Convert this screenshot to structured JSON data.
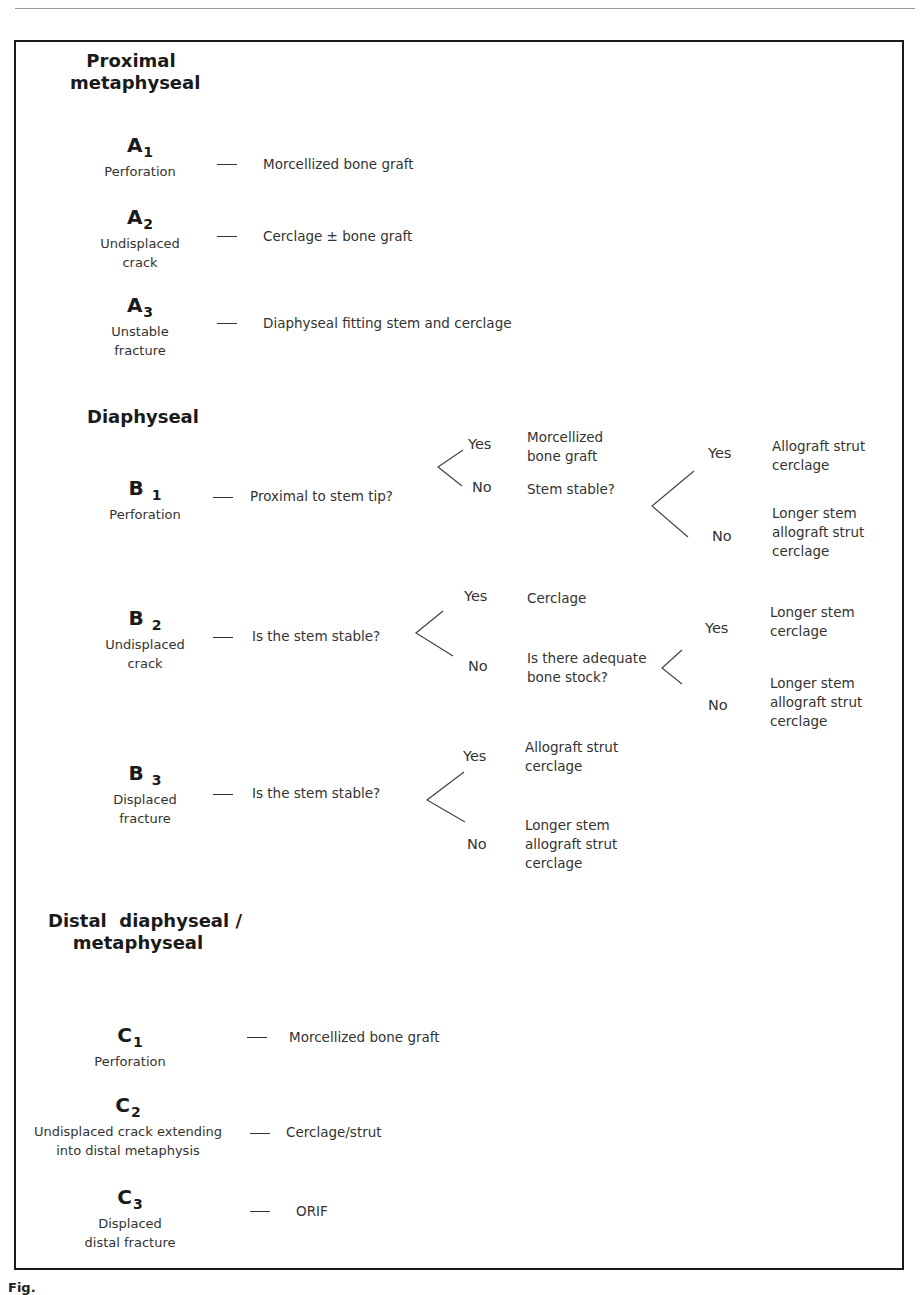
{
  "sections": [
    {
      "heading_lines": [
        "Proximal",
        "metaphyseal"
      ],
      "items": [
        {
          "code": "A",
          "sub": "1",
          "desc_lines": [
            "Perforation"
          ],
          "treatment": "Morcellized bone graft"
        },
        {
          "code": "A",
          "sub": "2",
          "desc_lines": [
            "Undisplaced",
            "crack"
          ],
          "treatment": "Cerclage ± bone graft"
        },
        {
          "code": "A",
          "sub": "3",
          "desc_lines": [
            "Unstable",
            "fracture"
          ],
          "treatment": "Diaphyseal fitting stem and cerclage"
        }
      ]
    },
    {
      "heading_lines": [
        "Diaphyseal"
      ],
      "items": [
        {
          "code": "B",
          "sub": "1",
          "desc_lines": [
            "Perforation"
          ],
          "question": "Proximal to stem tip?",
          "yes": {
            "label": "Yes",
            "outcome_lines": [
              "Morcellized",
              "bone graft"
            ]
          },
          "no": {
            "label": "No",
            "question": "Stem stable?",
            "yes": {
              "label": "Yes",
              "outcome_lines": [
                "Allograft strut",
                "cerclage"
              ]
            },
            "no": {
              "label": "No",
              "outcome_lines": [
                "Longer stem",
                "allograft strut",
                "cerclage"
              ]
            }
          }
        },
        {
          "code": "B",
          "sub": "2",
          "desc_lines": [
            "Undisplaced",
            "crack"
          ],
          "question": "Is the stem stable?",
          "yes": {
            "label": "Yes",
            "outcome_lines": [
              "Cerclage"
            ]
          },
          "no": {
            "label": "No",
            "question_lines": [
              "Is there adequate",
              "bone stock?"
            ],
            "yes": {
              "label": "Yes",
              "outcome_lines": [
                "Longer stem",
                "cerclage"
              ]
            },
            "no": {
              "label": "No",
              "outcome_lines": [
                "Longer stem",
                "allograft strut",
                "cerclage"
              ]
            }
          }
        },
        {
          "code": "B",
          "sub": "3",
          "desc_lines": [
            "Displaced",
            "fracture"
          ],
          "question": "Is the stem stable?",
          "yes": {
            "label": "Yes",
            "outcome_lines": [
              "Allograft strut",
              "cerclage"
            ]
          },
          "no": {
            "label": "No",
            "outcome_lines": [
              "Longer stem",
              "allograft strut",
              "cerclage"
            ]
          }
        }
      ]
    },
    {
      "heading_lines": [
        "Distal  diaphyseal /",
        "metaphyseal"
      ],
      "items": [
        {
          "code": "C",
          "sub": "1",
          "desc_lines": [
            "Perforation"
          ],
          "treatment": "Morcellized bone graft"
        },
        {
          "code": "C",
          "sub": "2",
          "desc_lines": [
            "Undisplaced crack extending",
            "into distal metaphysis"
          ],
          "treatment": "Cerclage/strut"
        },
        {
          "code": "C",
          "sub": "3",
          "desc_lines": [
            "Displaced",
            "distal fracture"
          ],
          "treatment": "ORIF"
        }
      ]
    }
  ],
  "caption": {
    "label": "Fig."
  }
}
